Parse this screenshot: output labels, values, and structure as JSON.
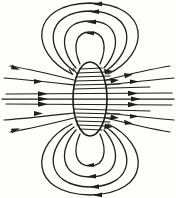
{
  "figure": {
    "background_color": "#fdfdfc",
    "line_color": "#201d1c",
    "coil_color": "#1a1718",
    "width": 176,
    "height": 198,
    "caption": ""
  },
  "chart_data": {
    "type": "line",
    "xlabel": "",
    "ylabel": "",
    "xlim": [
      0,
      176
    ],
    "ylim": [
      0,
      198
    ],
    "grid": false,
    "legend": false,
    "center": {
      "x": 90,
      "y": 99
    },
    "coil": {
      "name": "coil-cross-section",
      "shape": "vertical-ellipse",
      "cx": 90,
      "cy": 99,
      "rx": 17,
      "ry": 37,
      "stroke_width": 1.6
    },
    "series": [
      {
        "name": "interior-horizontal-lines",
        "description": "Field lines passing straight through the coil interior, pointing right",
        "direction": "right",
        "count": 13,
        "y_values": [
          68,
          73,
          78,
          82,
          86,
          90,
          95,
          99,
          104,
          108,
          113,
          118,
          124
        ]
      },
      {
        "name": "upper-closed-loops",
        "description": "Nested closed field loops above the coil, arrows pointing left",
        "direction": "left",
        "count": 4,
        "loop_radii_x": [
          24,
          38,
          52,
          66
        ],
        "loop_radii_y": [
          20,
          32,
          44,
          56
        ]
      },
      {
        "name": "lower-closed-loops",
        "description": "Nested closed field loops below the coil, arrows pointing left",
        "direction": "left",
        "count": 4,
        "loop_radii_x": [
          24,
          38,
          52,
          66
        ],
        "loop_radii_y": [
          20,
          32,
          44,
          56
        ]
      },
      {
        "name": "outer-flaring-lines",
        "description": "Outermost field lines flaring away from the coil axis on both sides",
        "direction": "right",
        "count": 6
      }
    ],
    "arrow_count": 24,
    "annotations": []
  },
  "elements": {
    "coil_label": "coil-cross-section",
    "upper_loops_label": "upper-field-loops",
    "lower_loops_label": "lower-field-loops",
    "axis_lines_label": "axial-field-lines",
    "hatch_label": "winding-hatch-marks"
  }
}
